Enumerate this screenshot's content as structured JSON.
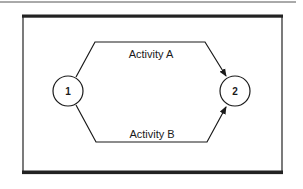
{
  "diagram": {
    "type": "activity-network",
    "nodes": [
      {
        "id": "1",
        "label": "1"
      },
      {
        "id": "2",
        "label": "2"
      }
    ],
    "edges": [
      {
        "from": "1",
        "to": "2",
        "label": "Activity A",
        "position": "top"
      },
      {
        "from": "1",
        "to": "2",
        "label": "Activity B",
        "position": "bottom"
      }
    ],
    "colors": {
      "line": "#1a1a1a",
      "border": "#222222",
      "background": "#ffffff"
    }
  }
}
